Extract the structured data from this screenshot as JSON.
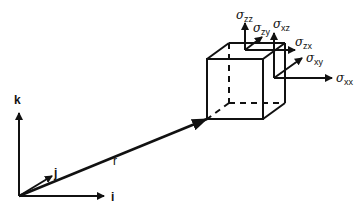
{
  "diagram": {
    "axes": {
      "k": "k",
      "j": "j",
      "i": "i"
    },
    "position_vector": "r",
    "stress_labels": {
      "zz": {
        "sym": "σ",
        "sub": "zz"
      },
      "zy": {
        "sym": "σ",
        "sub": "zy"
      },
      "xz": {
        "sym": "σ",
        "sub": "xz"
      },
      "zx": {
        "sym": "σ",
        "sub": "zx"
      },
      "xy": {
        "sym": "σ",
        "sub": "xy"
      },
      "xx": {
        "sym": "σ",
        "sub": "xx"
      }
    },
    "colors": {
      "stroke": "#111111",
      "background": "#ffffff"
    }
  }
}
